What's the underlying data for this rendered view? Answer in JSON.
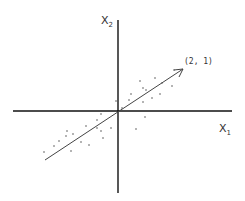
{
  "diagram": {
    "axis_labels": {
      "x1": "X",
      "x1_sub": "1",
      "x2": "X",
      "x2_sub": "2"
    },
    "vector_label": "(2, 1)",
    "vector": {
      "x": 2,
      "y": 1
    },
    "colors": {
      "axes": "#111111",
      "vector": "#444444",
      "points": "#555555"
    }
  }
}
